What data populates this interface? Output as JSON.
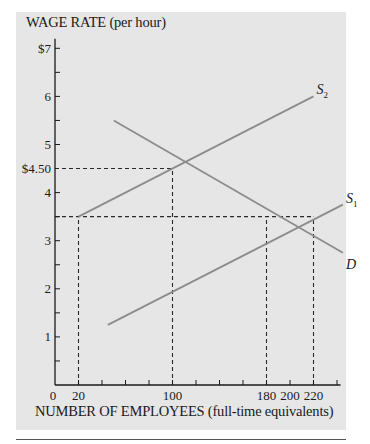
{
  "chart_data": {
    "type": "line",
    "title": "",
    "ylabel": "WAGE RATE (per hour)",
    "xlabel": "NUMBER OF EMPLOYEES (full-time equivalents)",
    "xlim": [
      0,
      240
    ],
    "ylim": [
      0,
      7
    ],
    "grid": false,
    "legend": "inline labels at line ends",
    "y_ticks": [
      {
        "value": 7,
        "label": "$7"
      },
      {
        "value": 6,
        "label": "6"
      },
      {
        "value": 5,
        "label": "5"
      },
      {
        "value": 4.5,
        "label": "$4.50"
      },
      {
        "value": 4,
        "label": "4"
      },
      {
        "value": 3,
        "label": "3"
      },
      {
        "value": 2,
        "label": "2"
      },
      {
        "value": 1,
        "label": "1"
      }
    ],
    "y_minor_ticks": [
      0.5,
      1.5,
      2.5,
      3.5,
      4.5,
      5.5,
      6.5
    ],
    "x_ticks": [
      {
        "value": 0,
        "label": "0"
      },
      {
        "value": 20,
        "label": "20"
      },
      {
        "value": 100,
        "label": "100"
      },
      {
        "value": 180,
        "label": "180"
      },
      {
        "value": 200,
        "label": "200"
      },
      {
        "value": 220,
        "label": "220"
      }
    ],
    "x_minor_ticks": [
      40,
      60,
      80,
      120,
      140,
      160,
      240
    ],
    "series": [
      {
        "name": "D",
        "label_main": "D",
        "label_sub": "",
        "points": [
          [
            50,
            5.5
          ],
          [
            245,
            2.75
          ]
        ]
      },
      {
        "name": "S2",
        "label_main": "S",
        "label_sub": "2",
        "points": [
          [
            20,
            3.5
          ],
          [
            220,
            6.0
          ]
        ]
      },
      {
        "name": "S1",
        "label_main": "S",
        "label_sub": "1",
        "points": [
          [
            45,
            1.25
          ],
          [
            245,
            3.75
          ]
        ]
      }
    ],
    "reference_lines": [
      {
        "type": "h",
        "y": 4.5,
        "x_from": 0,
        "x_to": 100
      },
      {
        "type": "v",
        "x": 100,
        "y_from": 0,
        "y_to": 4.5
      },
      {
        "type": "h",
        "y": 3.5,
        "x_from": 0,
        "x_to": 220
      },
      {
        "type": "v",
        "x": 20,
        "y_from": 0,
        "y_to": 3.5
      },
      {
        "type": "v",
        "x": 180,
        "y_from": 0,
        "y_to": 3.5
      },
      {
        "type": "v",
        "x": 220,
        "y_from": 0,
        "y_to": 3.5
      }
    ],
    "annotations": [
      "S2 and D intersect at (100, $4.50)",
      "At $3.50: S2 supplies 20, D demands 180, S1 supplies 220"
    ]
  },
  "colors": {
    "panel_bg": "#e6e6e6",
    "curve": "#8c8c8c",
    "axis": "#1a1a1a",
    "dashed": "#2a2a2a"
  }
}
